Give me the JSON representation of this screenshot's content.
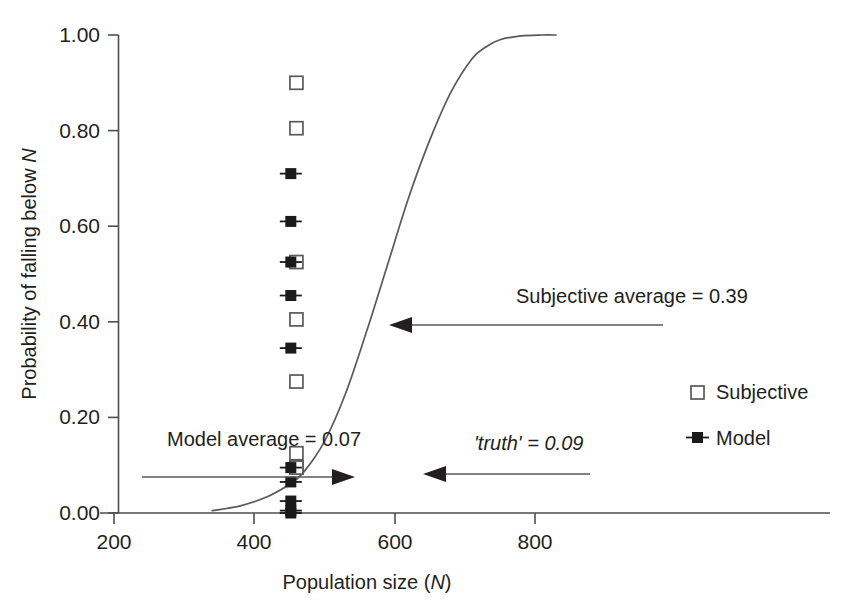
{
  "chart_data": {
    "type": "scatter",
    "title": "",
    "xlabel": "Population size (N)",
    "ylabel": "Probability of falling below N",
    "xlabel_plain": "Population size (",
    "xlabel_ital": "N",
    "xlabel_tail": ")",
    "ylabel_plain": "Probability of falling below ",
    "ylabel_ital": "N",
    "xlim": [
      200,
      900
    ],
    "ylim": [
      0.0,
      1.0
    ],
    "grid": false,
    "x_ticks": [
      200,
      400,
      600,
      800
    ],
    "x_tick_labels": [
      "200",
      "400",
      "600",
      "800"
    ],
    "y_ticks": [
      0.0,
      0.2,
      0.4,
      0.6,
      0.8,
      1.0
    ],
    "y_tick_labels": [
      "0.00",
      "0.20",
      "0.40",
      "0.60",
      "0.80",
      "1.00"
    ],
    "legend_position": "right-middle",
    "series": [
      {
        "name": "Subjective",
        "marker": "open-square",
        "x": [
          460,
          460,
          460,
          460,
          460,
          460,
          460,
          460
        ],
        "values": [
          0.9,
          0.805,
          0.525,
          0.405,
          0.275,
          0.125,
          0.095,
          0.095
        ]
      },
      {
        "name": "Model",
        "marker": "filled-square-whiskers",
        "x": [
          452,
          452,
          452,
          452,
          452,
          452,
          452,
          452,
          452,
          452
        ],
        "values": [
          0.71,
          0.61,
          0.525,
          0.455,
          0.345,
          0.095,
          0.065,
          0.025,
          0.005,
          0.0
        ]
      },
      {
        "name": "truth curve",
        "marker": "line",
        "x": [
          340,
          380,
          420,
          450,
          470,
          500,
          530,
          560,
          590,
          620,
          650,
          680,
          710,
          730,
          750,
          780,
          810,
          830
        ],
        "values": [
          0.005,
          0.015,
          0.035,
          0.06,
          0.085,
          0.15,
          0.25,
          0.38,
          0.52,
          0.66,
          0.78,
          0.88,
          0.95,
          0.975,
          0.99,
          0.998,
          1.0,
          1.0
        ]
      }
    ],
    "annotations": [
      {
        "id": "subjective-average",
        "text": "Subjective average = 0.39",
        "value": 0.39,
        "style": "normal",
        "arrow": "left"
      },
      {
        "id": "model-average",
        "text": "Model average = 0.07",
        "value": 0.07,
        "style": "normal",
        "arrow": "right"
      },
      {
        "id": "truth",
        "text": "'truth' = 0.09",
        "value": 0.09,
        "style": "italic",
        "arrow": "left"
      }
    ],
    "legend": [
      {
        "label": "Subjective",
        "marker": "open-square"
      },
      {
        "label": "Model",
        "marker": "filled-square-whiskers"
      }
    ],
    "colors": {
      "ink": "#231f20",
      "line": "#58595b",
      "marker_fill": "#1a1a1a",
      "background": "#ffffff"
    }
  }
}
